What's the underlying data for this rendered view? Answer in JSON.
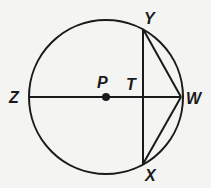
{
  "diagram": {
    "type": "circle-geometry",
    "stroke_color": "#1a1a1a",
    "background": "#f4f4f2",
    "circle": {
      "center_label": "P",
      "cx": 106,
      "cy": 97,
      "r": 77
    },
    "points": [
      {
        "label": "Z",
        "x": 28,
        "y": 97
      },
      {
        "label": "P",
        "x": 106,
        "y": 97
      },
      {
        "label": "T",
        "x": 143,
        "y": 97
      },
      {
        "label": "W",
        "x": 181,
        "y": 97
      },
      {
        "label": "Y",
        "x": 143,
        "y": 29
      },
      {
        "label": "X",
        "x": 143,
        "y": 164
      }
    ],
    "segments": [
      "ZW",
      "YX",
      "YW",
      "XW"
    ],
    "labels": {
      "Z": "Z",
      "P": "P",
      "T": "T",
      "W": "W",
      "Y": "Y",
      "X": "X"
    }
  }
}
